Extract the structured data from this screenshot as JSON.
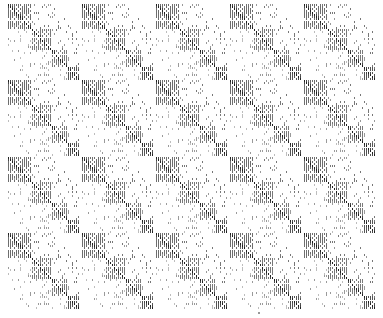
{
  "image": {
    "width": 383,
    "height": 318,
    "background": "#ffffff",
    "description": "Tiled sparse-matrix pattern"
  },
  "layout": {
    "columns": 5,
    "rows": 4,
    "col_starts": [
      8,
      82,
      156,
      230,
      304
    ],
    "row_starts": [
      4,
      80,
      157,
      233
    ],
    "tile_width": 72,
    "tile_height": 74,
    "cell": 2
  },
  "tile": {
    "grid_size": 36,
    "diagonal_blocks": [
      {
        "start": 0,
        "size": 12,
        "fill": "#6e6e6e"
      },
      {
        "start": 12,
        "size": 10,
        "fill": "#787878"
      },
      {
        "start": 22,
        "size": 8,
        "fill": "#7a7a7a"
      },
      {
        "start": 30,
        "size": 6,
        "fill": "#555555"
      }
    ],
    "colors": {
      "diagonal": "#222222",
      "dense": "#777777",
      "sparse": "#9a9a9a",
      "light": "#bdbdbd"
    }
  },
  "marks": [
    {
      "x": 258,
      "y": 312
    }
  ]
}
